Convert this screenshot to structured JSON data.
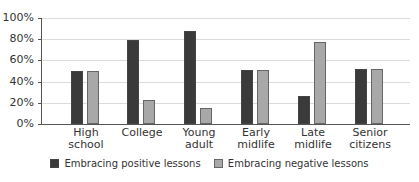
{
  "chart_data": {
    "type": "bar",
    "title": "",
    "xlabel": "",
    "ylabel": "",
    "ylim": [
      0,
      100
    ],
    "yticks": [
      "0%",
      "20%",
      "40%",
      "60%",
      "80%",
      "100%"
    ],
    "grid": true,
    "legend_position": "bottom",
    "categories": [
      "High school",
      "College",
      "Young adult",
      "Early midlife",
      "Late midlife",
      "Senior citizens"
    ],
    "category_lines": [
      [
        "High",
        "school"
      ],
      [
        "College",
        ""
      ],
      [
        "Young",
        "adult"
      ],
      [
        "Early",
        "midlife"
      ],
      [
        "Late",
        "midlife"
      ],
      [
        "Senior",
        "citizens"
      ]
    ],
    "series": [
      {
        "name": "Embracing positive lessons",
        "color": "#3a3a3a",
        "values": [
          50,
          79,
          88,
          51,
          26,
          52
        ]
      },
      {
        "name": "Embracing negative lessons",
        "color": "#a8a8a8",
        "values": [
          50,
          23,
          15,
          51,
          77,
          52
        ]
      }
    ]
  }
}
